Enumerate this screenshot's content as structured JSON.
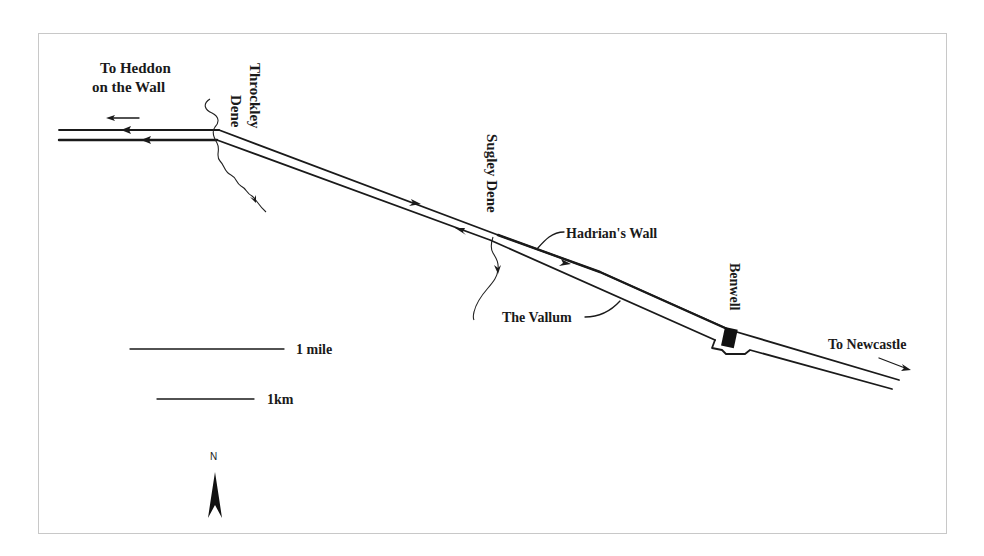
{
  "map": {
    "labels": {
      "heddon_line1": "To Heddon",
      "heddon_line2": "on the Wall",
      "throckley_line1": "Throckley",
      "throckley_line2": "Dene",
      "sugley": "Sugley Dene",
      "hadrians_wall": "Hadrian's Wall",
      "vallum": "The Vallum",
      "benwell": "Benwell",
      "newcastle": "To Newcastle"
    },
    "scale": {
      "mile_label": "1 mile",
      "km_label": "1km"
    },
    "north_arrow": {
      "label": "N"
    },
    "colors": {
      "ink": "#1a1a1a",
      "frame": "#c8c8c8",
      "background": "#ffffff"
    }
  }
}
